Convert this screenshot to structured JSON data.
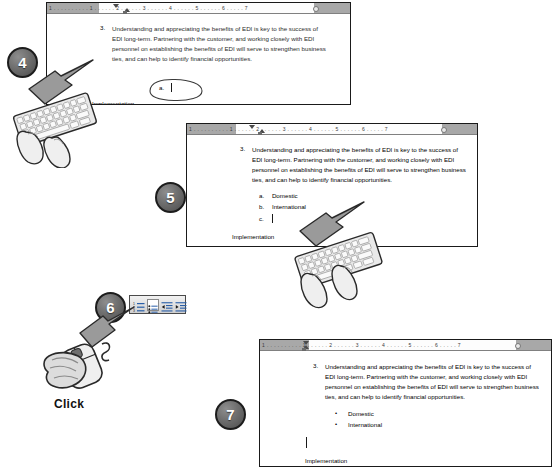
{
  "document": {
    "paragraph_number": "3.",
    "paragraph_text": "Understanding and appreciating the benefits of EDI is key to the success of EDI long-term.  Partnering with the customer, and working closely with EDI personnel on establishing the benefits of EDI will serve to strengthen business ties, and can help to identify financial opportunities.",
    "footer_text": "Implementation",
    "ruler_scale": "1 . . . . . . . . . . 1 . . . . . . 2 . . . . . . 3 . . . . . . 4 . . . . . . 5 . . . . . . 6 . . . . . 7"
  },
  "panels": [
    {
      "id": "panel-step4",
      "step": "4",
      "list_style": "lettered",
      "items": [
        {
          "label": "a.",
          "text": "",
          "caret": true
        }
      ],
      "annotation": "circled-cursor",
      "footer_text": "Implementation"
    },
    {
      "id": "panel-step5",
      "step": "5",
      "list_style": "lettered",
      "items": [
        {
          "label": "a.",
          "text": "Domestic",
          "caret": false
        },
        {
          "label": "b.",
          "text": "International",
          "caret": false
        },
        {
          "label": "c.",
          "text": "",
          "caret": true
        }
      ],
      "footer_text": "Implementation"
    },
    {
      "id": "panel-step7",
      "step": "7",
      "list_style": "bulleted",
      "items": [
        {
          "label": "•",
          "text": "Domestic",
          "caret": false
        },
        {
          "label": "•",
          "text": "International",
          "caret": false
        }
      ],
      "footer_text": "Implementation"
    }
  ],
  "step6": {
    "step": "6",
    "action_label": "Click",
    "toolbar": {
      "name": "formatting-toolbar",
      "buttons": [
        {
          "name": "numbered-list-button",
          "title": "Numbering"
        },
        {
          "name": "bulleted-list-button",
          "title": "Bullets"
        },
        {
          "name": "decrease-indent-button",
          "title": "Decrease Indent"
        },
        {
          "name": "increase-indent-button",
          "title": "Increase Indent"
        }
      ],
      "selected_index": 1
    }
  },
  "colors": {
    "panel_border": "#1a1a1a",
    "ruler_gray": "#a8a8a8",
    "text": "#2b2b2b",
    "arrow_fill": "#9a9a9a",
    "step_circle": "#5c5c5c"
  }
}
